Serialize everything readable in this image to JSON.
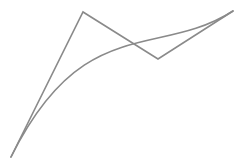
{
  "diagram": {
    "type": "cubic-bezier-with-control-polygon",
    "width": 245,
    "height": 165,
    "background": "#ffffff",
    "stroke_color": "#8a8a8a",
    "stroke_width": 1.6,
    "control_points": [
      {
        "x": 11,
        "y": 157
      },
      {
        "x": 83,
        "y": 12
      },
      {
        "x": 158,
        "y": 59
      },
      {
        "x": 233,
        "y": 11
      }
    ]
  }
}
